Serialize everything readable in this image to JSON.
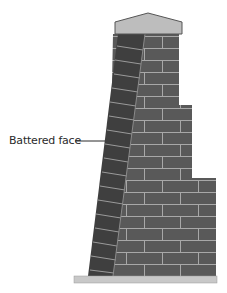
{
  "diagram": {
    "type": "buttress-wall-cross-section",
    "labels": [
      {
        "text": "Battered face",
        "target": "sloped left face of wall"
      }
    ],
    "colors": {
      "cap": "#bdbdbd",
      "battered_face_bricks": "#3f3f3f",
      "main_bricks": "#595959",
      "mortar": "#a8a8a8",
      "base_slab": "#c8c8c8",
      "leader_line": "#2a2a2a"
    }
  }
}
